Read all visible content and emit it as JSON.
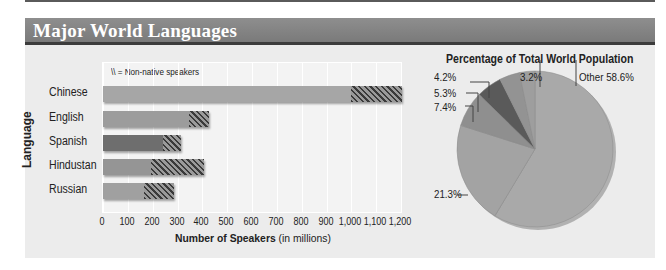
{
  "header": {
    "title": "Major World Languages"
  },
  "chart_data": [
    {
      "type": "bar",
      "orientation": "horizontal",
      "stacked": true,
      "title": "",
      "xlabel": "Number of Speakers",
      "xlabel_suffix": "(in millions)",
      "ylabel": "Language",
      "legend_note": "\\\\ = Non-native speakers",
      "categories": [
        "Chinese",
        "English",
        "Spanish",
        "Hindustan",
        "Russian"
      ],
      "series": [
        {
          "name": "Native speakers",
          "values": [
            1000,
            345,
            240,
            195,
            165
          ]
        },
        {
          "name": "Non-native speakers",
          "values": [
            205,
            80,
            75,
            210,
            120
          ]
        }
      ],
      "totals": [
        1205,
        425,
        315,
        405,
        285
      ],
      "xlim": [
        0,
        1200
      ],
      "xticks": [
        "0",
        "100",
        "200",
        "300",
        "400",
        "500",
        "600",
        "700",
        "800",
        "900",
        "1,000",
        "1,100",
        "1,200"
      ],
      "grid": true,
      "colors": {
        "Chinese": "#a6a6a6",
        "English": "#9c9c9c",
        "Spanish": "#6e6e6e",
        "Hindustan": "#959595",
        "Russian": "#a0a0a0"
      }
    },
    {
      "type": "pie",
      "title": "Percentage of Total World Population",
      "slices": [
        {
          "label": "Other 58.6%",
          "value": 58.6,
          "color": "#a9a9a9"
        },
        {
          "label": "21.3%",
          "value": 21.3,
          "color": "#a3a3a3"
        },
        {
          "label": "7.4%",
          "value": 7.4,
          "color": "#8f8f8f"
        },
        {
          "label": "5.3%",
          "value": 5.3,
          "color": "#5a5a5a"
        },
        {
          "label": "4.2%",
          "value": 4.2,
          "color": "#939393"
        },
        {
          "label": "3.2%",
          "value": 3.2,
          "color": "#9e9e9e"
        }
      ]
    }
  ],
  "labels": {
    "legend": "\\\\ = Non-native speakers",
    "ylabel": "Language",
    "xlabel_bold": "Number of Speakers",
    "xlabel_rest": " (in millions)",
    "pie_title": "Percentage of Total World Population",
    "pie": {
      "other": "Other 58.6%",
      "p213": "21.3%",
      "p74": "7.4%",
      "p53": "5.3%",
      "p42": "4.2%",
      "p32": "3.2%"
    }
  }
}
